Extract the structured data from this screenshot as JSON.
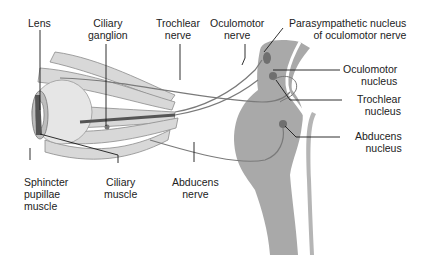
{
  "diagram": {
    "type": "anatomical-illustration",
    "colors": {
      "brainstem": "#a9a9a9",
      "nucleus": "#6f6f6f",
      "muscle": "#9a9a9a",
      "nerve": "#7a7a7a",
      "leader_line": "#1a1a1a",
      "text": "#222222"
    },
    "labels": {
      "lens": "Lens",
      "ciliary_ganglion": "Ciliary\nganglion",
      "trochlear_nerve": "Trochlear\nnerve",
      "oculomotor_nerve": "Oculomotor\nnerve",
      "parasympathetic_nucleus": "Parasympathetic nucleus\nof oculomotor nerve",
      "oculomotor_nucleus": "Oculomotor\nnucleus",
      "trochlear_nucleus": "Trochlear\nnucleus",
      "abducens_nucleus": "Abducens\nnucleus",
      "sphincter_pupillae": "Sphincter\npupillae\nmuscle",
      "ciliary_muscle": "Ciliary\nmuscle",
      "abducens_nerve": "Abducens\nnerve"
    }
  }
}
